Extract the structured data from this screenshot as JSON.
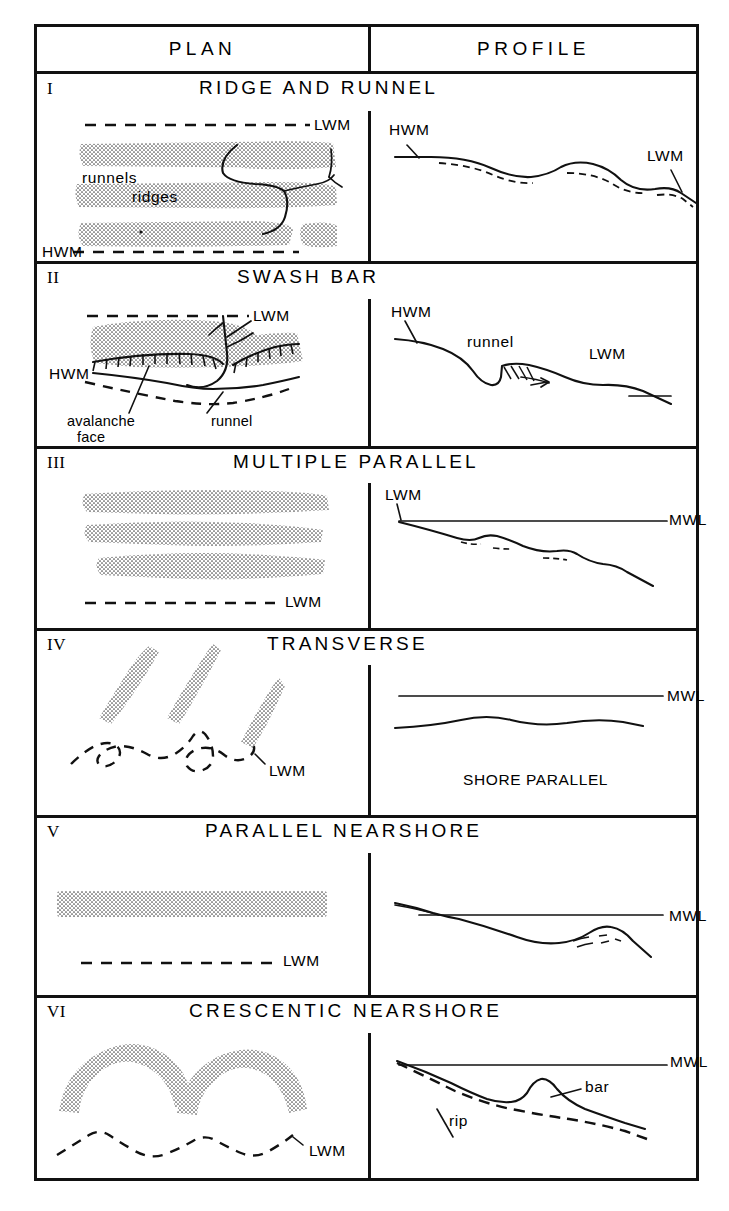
{
  "figure": {
    "kind": "beach-and-nearshore-bar-morphology-chart",
    "columns": [
      {
        "key": "plan",
        "label": "PLAN"
      },
      {
        "key": "profile",
        "label": "PROFILE"
      }
    ],
    "rows": [
      {
        "numeral": "I",
        "title": "RIDGE AND RUNNEL",
        "plan_labels": [
          "LWM",
          "runnels",
          "ridges",
          "HWM"
        ],
        "profile_labels": [
          "HWM",
          "LWM"
        ]
      },
      {
        "numeral": "II",
        "title": "SWASH BAR",
        "plan_labels": [
          "LWM",
          "HWM",
          "avalanche",
          "face",
          "runnel"
        ],
        "profile_labels": [
          "HWM",
          "runnel",
          "LWM"
        ]
      },
      {
        "numeral": "III",
        "title": "MULTIPLE PARALLEL",
        "plan_labels": [
          "LWM"
        ],
        "profile_labels": [
          "LWM",
          "MWL"
        ]
      },
      {
        "numeral": "IV",
        "title": "TRANSVERSE",
        "plan_labels": [
          "LWM"
        ],
        "profile_labels": [
          "MWL",
          "SHORE PARALLEL"
        ]
      },
      {
        "numeral": "V",
        "title": "PARALLEL NEARSHORE",
        "plan_labels": [
          "LWM"
        ],
        "profile_labels": [
          "MWL"
        ]
      },
      {
        "numeral": "VI",
        "title": "CRESCENTIC NEARSHORE",
        "plan_labels": [
          "LWM"
        ],
        "profile_labels": [
          "MWL",
          "bar",
          "rip"
        ]
      }
    ],
    "row1": {
      "numeral": "I",
      "title": "RIDGE AND RUNNEL",
      "lwm": "LWM",
      "runnels": "runnels",
      "ridges": "ridges",
      "hwm": "HWM",
      "p_hwm": "HWM",
      "p_lwm": "LWM"
    },
    "row2": {
      "numeral": "II",
      "title": "SWASH BAR",
      "lwm": "LWM",
      "hwm": "HWM",
      "avalanche": "avalanche",
      "face": "face",
      "runnel": "runnel",
      "p_hwm": "HWM",
      "p_runnel": "runnel",
      "p_lwm": "LWM"
    },
    "row3": {
      "numeral": "III",
      "title": "MULTIPLE PARALLEL",
      "lwm": "LWM",
      "p_lwm": "LWM",
      "p_mwl": "MWL"
    },
    "row4": {
      "numeral": "IV",
      "title": "TRANSVERSE",
      "lwm": "LWM",
      "p_mwl": "MWL",
      "p_caption": "SHORE PARALLEL"
    },
    "row5": {
      "numeral": "V",
      "title": "PARALLEL NEARSHORE",
      "lwm": "LWM",
      "p_mwl": "MWL"
    },
    "row6": {
      "numeral": "VI",
      "title": "CRESCENTIC NEARSHORE",
      "lwm": "LWM",
      "p_mwl": "MWL",
      "p_bar": "bar",
      "p_rip": "rip"
    },
    "colors": {
      "ink": "#111111",
      "paper": "#ffffff",
      "stipple": "#555555"
    }
  }
}
